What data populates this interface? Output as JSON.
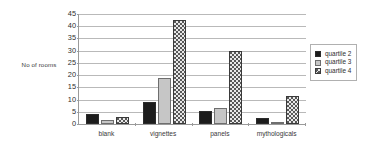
{
  "chart_data": {
    "type": "bar",
    "title": "",
    "xlabel": "",
    "ylabel": "No of rooms",
    "categories": [
      "blank",
      "vignettes",
      "panels",
      "mythologicals"
    ],
    "series": [
      {
        "name": "quartile 2",
        "values": [
          4,
          9,
          5.5,
          2.5
        ],
        "color": "#1c1c1c",
        "pattern": "solid-black"
      },
      {
        "name": "quartile 3",
        "values": [
          1.8,
          19,
          6.5,
          1
        ],
        "color": "#c6c6c6",
        "pattern": "solid-light-gray"
      },
      {
        "name": "quartile 4",
        "values": [
          3,
          42.5,
          30,
          11.5
        ],
        "color": "#585858",
        "pattern": "checkered"
      }
    ],
    "ylim": [
      0,
      45
    ],
    "ytick_step": 5,
    "yticks": [
      0,
      5,
      10,
      15,
      20,
      25,
      30,
      35,
      40,
      45
    ],
    "ytick_labels": [
      "0",
      "5",
      "10",
      "15",
      "20",
      "25",
      "30",
      "35",
      "40",
      "45"
    ],
    "grid": true,
    "legend_position": "right"
  },
  "legend": {
    "items": [
      {
        "label": "quartile 2"
      },
      {
        "label": "quartile 3"
      },
      {
        "label": "quartile 4"
      }
    ]
  }
}
